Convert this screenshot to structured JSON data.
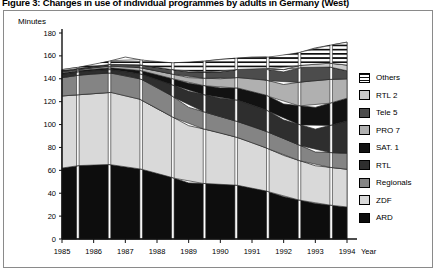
{
  "figure": {
    "title": "Figure 3: Changes in use of individual programmes by adults in Germany (West)"
  },
  "axes": {
    "y_unit_label": "Minutes",
    "x_unit_label": "Year",
    "y_ticks": [
      "0",
      "20",
      "40",
      "60",
      "80",
      "100",
      "120",
      "140",
      "160",
      "180"
    ],
    "x_ticks": [
      "1985",
      "1986",
      "1987",
      "1988",
      "1989",
      "1990",
      "1991",
      "1992",
      "1993",
      "1994"
    ]
  },
  "legend": {
    "items": [
      {
        "label": "Others",
        "pattern": "horizontal-stripes",
        "color": "#ffffff"
      },
      {
        "label": "RTL 2",
        "pattern": "solid",
        "color": "#c9c9c9"
      },
      {
        "label": "Tele 5",
        "pattern": "solid",
        "color": "#4c4c4c"
      },
      {
        "label": "PRO 7",
        "pattern": "solid",
        "color": "#b0b0b0"
      },
      {
        "label": "SAT. 1",
        "pattern": "solid",
        "color": "#121212"
      },
      {
        "label": "RTL",
        "pattern": "solid",
        "color": "#2e2e2e"
      },
      {
        "label": "Regionals",
        "pattern": "solid",
        "color": "#848484"
      },
      {
        "label": "ZDF",
        "pattern": "solid",
        "color": "#d9d9d9"
      },
      {
        "label": "ARD",
        "pattern": "solid",
        "color": "#0d0d0d"
      }
    ]
  },
  "chart_data": {
    "type": "area",
    "title": "Figure 3: Changes in use of individual programmes by adults in Germany (West)",
    "xlabel": "Year",
    "ylabel": "Minutes",
    "ylim": [
      0,
      180
    ],
    "grid": false,
    "legend_position": "right",
    "stacked": true,
    "categories": [
      "1985",
      "1986",
      "1987",
      "1988",
      "1989",
      "1990",
      "1991",
      "1992",
      "1993",
      "1994"
    ],
    "series": [
      {
        "name": "ARD",
        "color": "#0d0d0d",
        "pattern": "solid",
        "values": [
          62,
          66,
          64,
          58,
          49,
          48,
          46,
          37,
          31,
          28
        ]
      },
      {
        "name": "ZDF",
        "color": "#d9d9d9",
        "pattern": "solid",
        "values": [
          63,
          61,
          65,
          56,
          50,
          45,
          39,
          36,
          33,
          33
        ]
      },
      {
        "name": "Regionals",
        "color": "#848484",
        "pattern": "solid",
        "values": [
          16,
          18,
          16,
          20,
          16,
          14,
          14,
          15,
          12,
          14
        ]
      },
      {
        "name": "RTL",
        "color": "#2e2e2e",
        "pattern": "solid",
        "values": [
          3,
          3,
          3,
          6,
          14,
          16,
          21,
          16,
          20,
          28
        ]
      },
      {
        "name": "SAT. 1",
        "color": "#121212",
        "pattern": "solid",
        "values": [
          1,
          1,
          2,
          4,
          7,
          9,
          12,
          14,
          19,
          20
        ]
      },
      {
        "name": "PRO 7",
        "color": "#b0b0b0",
        "pattern": "solid",
        "values": [
          1,
          1,
          2,
          3,
          5,
          8,
          10,
          17,
          24,
          17
        ]
      },
      {
        "name": "Tele 5",
        "color": "#4c4c4c",
        "pattern": "solid",
        "values": [
          1,
          1,
          2,
          3,
          5,
          6,
          8,
          11,
          14,
          7
        ]
      },
      {
        "name": "RTL 2",
        "color": "#c9c9c9",
        "pattern": "solid",
        "values": [
          0,
          0,
          0,
          0,
          0,
          0,
          0,
          2,
          2,
          5
        ]
      },
      {
        "name": "Others",
        "color": "#ffffff",
        "pattern": "horizontal-stripes",
        "values": [
          1,
          1,
          5,
          4,
          8,
          11,
          9,
          11,
          12,
          20
        ]
      }
    ],
    "totals": [
      148,
      152,
      159,
      154,
      154,
      157,
      159,
      159,
      167,
      172
    ]
  }
}
